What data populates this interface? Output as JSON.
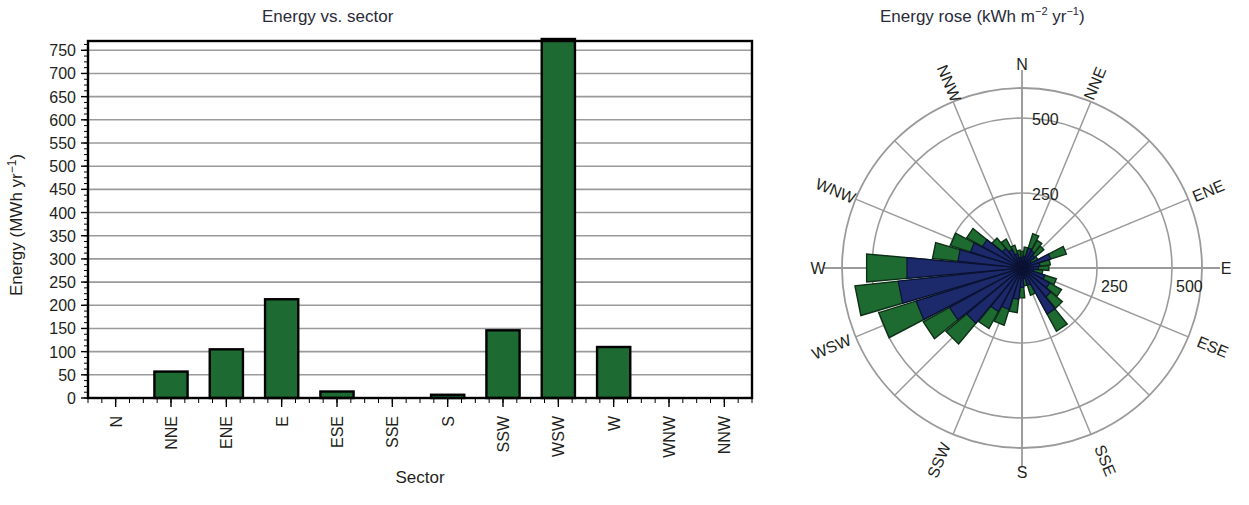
{
  "figure": {
    "bar_panel_title": "Energy vs. sector",
    "rose_panel_title": "Energy rose (kWh m−2 yr−1)",
    "rose_title_parts": {
      "main": "Energy rose (kWh",
      "unit_m": "m",
      "unit_m_sup": "−2",
      "unit_yr": "yr",
      "unit_yr_sup": "−1",
      "close": ")"
    },
    "colors": {
      "petal_outer_green": "#1e6b32",
      "petal_inner_navy": "#1c2a6b",
      "bar_green": "#1d6b33",
      "bar_outline": "#000000",
      "grid": "#9a9a9a",
      "axis": "#000000",
      "title_text": "#2a2a3a"
    }
  },
  "chart_data": [
    {
      "type": "bar",
      "title": "Energy vs. sector",
      "xlabel": "Sector",
      "ylabel": "Energy (MWh yr−1)",
      "ylabel_parts": {
        "lead": "Energy (MWh yr",
        "sup": "−1",
        "close": ")"
      },
      "categories": [
        "N",
        "NNE",
        "ENE",
        "E",
        "ESE",
        "SSE",
        "S",
        "SSW",
        "WSW",
        "W",
        "WNW",
        "NNW"
      ],
      "values": [
        0,
        57,
        105,
        213,
        14,
        0,
        7,
        146,
        980,
        110,
        0,
        0
      ],
      "clipped": {
        "WSW": true
      },
      "ylim": [
        0,
        770
      ],
      "yticks": [
        0,
        50,
        100,
        150,
        200,
        250,
        300,
        350,
        400,
        450,
        500,
        550,
        600,
        650,
        700,
        750
      ],
      "ytick_labels": [
        "0",
        "50",
        "100",
        "150",
        "200",
        "250",
        "300",
        "350",
        "400",
        "450",
        "500",
        "550",
        "600",
        "650",
        "700",
        "750"
      ],
      "grid": "horizontal",
      "minor_ticks": true,
      "legend": "none"
    },
    {
      "type": "rose",
      "title": "Energy rose (kWh m−2 yr−1)",
      "directions": [
        "N",
        "NNE",
        "NE",
        "ENE",
        "E",
        "ESE",
        "SE",
        "SSE",
        "S",
        "SSW",
        "SW",
        "WSW",
        "W",
        "WNW",
        "NW",
        "NNW"
      ],
      "labelled_directions": [
        "N",
        "NNE",
        "ENE",
        "E",
        "ESE",
        "SSE",
        "S",
        "SSW",
        "WSW",
        "W",
        "WNW",
        "NNW"
      ],
      "radial_ticks": [
        250,
        500
      ],
      "radial_tick_labels": [
        "250",
        "500"
      ],
      "rmax": 600,
      "series": [
        {
          "name": "outer-green",
          "sector_count": 32,
          "values": [
            55,
            70,
            120,
            105,
            95,
            60,
            155,
            95,
            90,
            70,
            120,
            150,
            175,
            240,
            95,
            60,
            100,
            150,
            200,
            230,
            330,
            375,
            500,
            560,
            520,
            300,
            250,
            210,
            130,
            110,
            80,
            60
          ]
        },
        {
          "name": "inner-navy",
          "sector_count": 32,
          "values": [
            30,
            40,
            70,
            65,
            55,
            35,
            100,
            60,
            55,
            40,
            80,
            105,
            125,
            175,
            60,
            35,
            65,
            105,
            145,
            165,
            240,
            275,
            370,
            415,
            385,
            215,
            180,
            150,
            85,
            70,
            50,
            35
          ]
        }
      ]
    }
  ]
}
